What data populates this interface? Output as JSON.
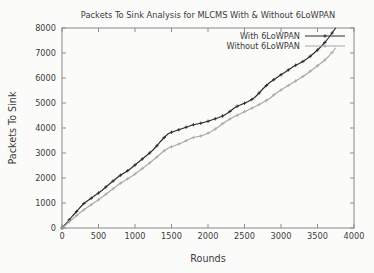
{
  "chart_data": {
    "type": "line",
    "title": "Packets To Sink Analysis for MLCMS With & Without 6LoWPAN",
    "xlabel": "Rounds",
    "ylabel": "Packets To Sink",
    "xlim": [
      0,
      4000
    ],
    "ylim": [
      0,
      8000
    ],
    "grid": false,
    "legend_position": "top-right",
    "xticks": [
      0,
      500,
      1000,
      1500,
      2000,
      2500,
      3000,
      3500,
      4000
    ],
    "xtick_labels": [
      "0",
      "500",
      "1000",
      "1500",
      "2000",
      "2500",
      "3000",
      "3500",
      "4000"
    ],
    "yticks": [
      0,
      1000,
      2000,
      3000,
      4000,
      5000,
      6000,
      7000,
      8000
    ],
    "ytick_labels": [
      "0",
      "1000",
      "2000",
      "3000",
      "4000",
      "5000",
      "6000",
      "7000",
      "8000"
    ],
    "series": [
      {
        "name": "With 6LoWPAN",
        "color": "#2a2a2a",
        "marker": "plus",
        "x": [
          0,
          50,
          100,
          150,
          200,
          250,
          300,
          350,
          400,
          450,
          500,
          550,
          600,
          650,
          700,
          750,
          800,
          850,
          900,
          950,
          1000,
          1050,
          1100,
          1150,
          1200,
          1250,
          1300,
          1350,
          1400,
          1450,
          1500,
          1550,
          1600,
          1650,
          1700,
          1750,
          1800,
          1850,
          1900,
          1950,
          2000,
          2050,
          2100,
          2150,
          2200,
          2250,
          2300,
          2350,
          2400,
          2450,
          2500,
          2550,
          2600,
          2650,
          2700,
          2750,
          2800,
          2850,
          2900,
          2950,
          3000,
          3050,
          3100,
          3150,
          3200,
          3250,
          3300,
          3350,
          3400,
          3450,
          3500,
          3550,
          3600,
          3650,
          3700,
          3750
        ],
        "y": [
          0,
          160,
          330,
          500,
          660,
          830,
          980,
          1090,
          1190,
          1300,
          1400,
          1510,
          1640,
          1760,
          1880,
          2000,
          2110,
          2200,
          2290,
          2400,
          2520,
          2640,
          2760,
          2880,
          3000,
          3130,
          3290,
          3460,
          3620,
          3760,
          3830,
          3880,
          3930,
          3980,
          4030,
          4080,
          4130,
          4160,
          4190,
          4230,
          4270,
          4320,
          4370,
          4420,
          4480,
          4560,
          4660,
          4780,
          4870,
          4930,
          4990,
          5060,
          5140,
          5250,
          5400,
          5560,
          5700,
          5830,
          5930,
          6030,
          6130,
          6220,
          6320,
          6420,
          6510,
          6580,
          6660,
          6760,
          6870,
          6990,
          7120,
          7260,
          7420,
          7600,
          7800,
          8010
        ]
      },
      {
        "name": "Without 6LoWPAN",
        "color": "#a8a8a8",
        "marker": "plus",
        "x": [
          0,
          50,
          100,
          150,
          200,
          250,
          300,
          350,
          400,
          450,
          500,
          550,
          600,
          650,
          700,
          750,
          800,
          850,
          900,
          950,
          1000,
          1050,
          1100,
          1150,
          1200,
          1250,
          1300,
          1350,
          1400,
          1450,
          1500,
          1550,
          1600,
          1650,
          1700,
          1750,
          1800,
          1850,
          1900,
          1950,
          2000,
          2050,
          2100,
          2150,
          2200,
          2250,
          2300,
          2350,
          2400,
          2450,
          2500,
          2550,
          2600,
          2650,
          2700,
          2750,
          2800,
          2850,
          2900,
          2950,
          3000,
          3050,
          3100,
          3150,
          3200,
          3250,
          3300,
          3350,
          3400,
          3450,
          3500,
          3550,
          3600,
          3650,
          3700,
          3750
        ],
        "y": [
          0,
          120,
          250,
          380,
          500,
          620,
          730,
          830,
          930,
          1030,
          1130,
          1240,
          1350,
          1460,
          1570,
          1680,
          1790,
          1880,
          1970,
          2060,
          2160,
          2270,
          2380,
          2490,
          2600,
          2720,
          2840,
          2970,
          3090,
          3190,
          3250,
          3300,
          3360,
          3420,
          3490,
          3560,
          3620,
          3650,
          3680,
          3730,
          3790,
          3870,
          3960,
          4060,
          4170,
          4270,
          4360,
          4440,
          4510,
          4580,
          4650,
          4720,
          4790,
          4860,
          4940,
          5020,
          5100,
          5190,
          5320,
          5430,
          5520,
          5610,
          5700,
          5790,
          5880,
          5970,
          6060,
          6160,
          6270,
          6380,
          6490,
          6600,
          6720,
          6860,
          7020,
          7210
        ]
      }
    ]
  }
}
